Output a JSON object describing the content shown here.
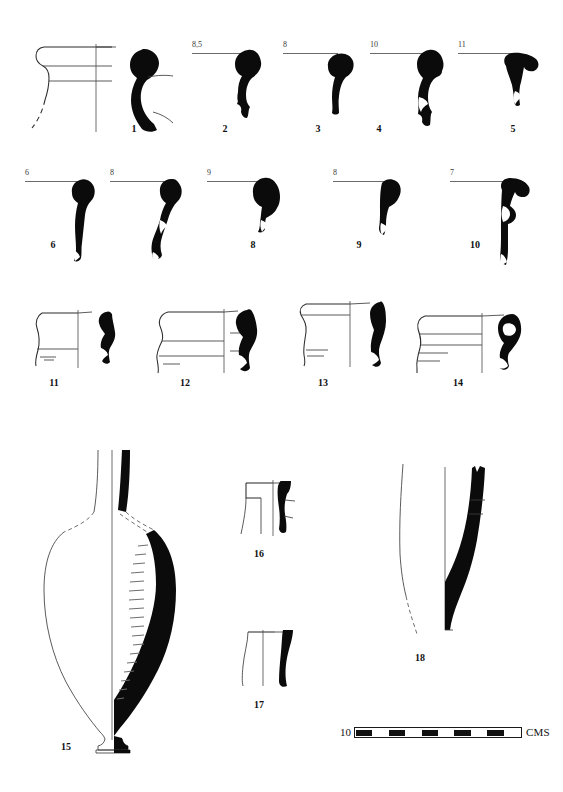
{
  "plate": {
    "title": "Ceramic profile plate",
    "background_color": "#ffffff",
    "ink_color": "#0b0b0b",
    "line_color": "#2b2b2b",
    "rule_color": "#6b6b6b"
  },
  "rows": [
    {
      "row_name": "row-1-rims",
      "items": [
        {
          "number": "1",
          "diameter": "",
          "has_profile_drawing": true,
          "has_silhouette": true
        },
        {
          "number": "2",
          "diameter": "8,5",
          "has_profile_drawing": false,
          "has_silhouette": true
        },
        {
          "number": "3",
          "diameter": "8",
          "has_profile_drawing": false,
          "has_silhouette": true
        },
        {
          "number": "4",
          "diameter": "10",
          "has_profile_drawing": false,
          "has_silhouette": true
        },
        {
          "number": "5",
          "diameter": "11",
          "has_profile_drawing": false,
          "has_silhouette": true
        }
      ]
    },
    {
      "row_name": "row-2-rims",
      "items": [
        {
          "number": "6",
          "diameter": "6",
          "has_profile_drawing": false,
          "has_silhouette": true
        },
        {
          "number": "7",
          "diameter": "8",
          "has_profile_drawing": false,
          "has_silhouette": true
        },
        {
          "number": "8",
          "diameter": "9",
          "has_profile_drawing": false,
          "has_silhouette": true
        },
        {
          "number": "9",
          "diameter": "8",
          "has_profile_drawing": false,
          "has_silhouette": true
        },
        {
          "number": "10",
          "diameter": "7",
          "has_profile_drawing": false,
          "has_silhouette": true
        }
      ]
    },
    {
      "row_name": "row-3-rims-with-sections",
      "items": [
        {
          "number": "11",
          "diameter": "",
          "has_profile_drawing": true,
          "has_silhouette": true
        },
        {
          "number": "12",
          "diameter": "",
          "has_profile_drawing": true,
          "has_silhouette": true
        },
        {
          "number": "13",
          "diameter": "",
          "has_profile_drawing": true,
          "has_silhouette": true
        },
        {
          "number": "14",
          "diameter": "",
          "has_profile_drawing": true,
          "has_silhouette": true
        }
      ]
    },
    {
      "row_name": "row-4-vessels",
      "items": [
        {
          "number": "15",
          "diameter": "",
          "has_profile_drawing": true,
          "has_silhouette": true
        },
        {
          "number": "16",
          "diameter": "",
          "has_profile_drawing": true,
          "has_silhouette": true
        },
        {
          "number": "17",
          "diameter": "",
          "has_profile_drawing": true,
          "has_silhouette": true
        },
        {
          "number": "18",
          "diameter": "",
          "has_profile_drawing": true,
          "has_silhouette": true
        }
      ]
    }
  ],
  "labels": {
    "n1": "1",
    "n2": "2",
    "n3": "3",
    "n4": "4",
    "n5": "5",
    "n6": "6",
    "n7": "7",
    "n8": "8",
    "n9": "9",
    "n10": "10",
    "n11": "11",
    "n12": "12",
    "n13": "13",
    "n14": "14",
    "n15": "15",
    "n16": "16",
    "n17": "17",
    "n18": "18"
  },
  "diameters": {
    "d2": "8,5",
    "d3": "8",
    "d4": "10",
    "d5": "11",
    "d6": "6",
    "d7": "8",
    "d8": "9",
    "d9": "8",
    "d10": "7"
  },
  "scale": {
    "value": "10",
    "unit": "CMS",
    "segments": [
      "on",
      "off",
      "on",
      "off",
      "on",
      "off",
      "on",
      "off",
      "on",
      "off"
    ],
    "segment_count": 10
  }
}
